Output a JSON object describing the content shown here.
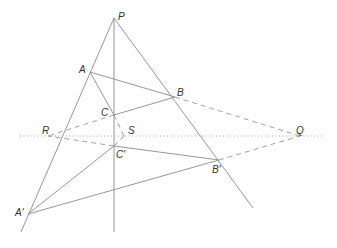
{
  "diagram": {
    "labels": {
      "P": "P",
      "A": "A",
      "B": "B",
      "C": "C",
      "S": "S",
      "R": "R",
      "Q": "Q",
      "C_prime": "C'",
      "B_prime": "B'",
      "A_prime": "A'"
    },
    "points": {
      "P": [
        114,
        18
      ],
      "A": [
        90,
        72
      ],
      "B": [
        175,
        97
      ],
      "C": [
        114,
        115
      ],
      "C_prime": [
        114,
        146
      ],
      "B_prime": [
        219,
        160
      ],
      "A_prime": [
        28,
        214
      ],
      "R": [
        48,
        136
      ],
      "Q": [
        300,
        136
      ],
      "S": [
        124,
        136
      ]
    },
    "line_color": "#8a8a8a",
    "label_color": "#333333"
  }
}
